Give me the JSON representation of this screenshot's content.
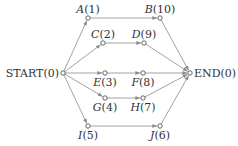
{
  "diagram": {
    "type": "activity-network",
    "nodes": [
      {
        "id": "START",
        "label": "START",
        "value": "0",
        "x": 63,
        "y": 73,
        "italic": false,
        "label_pos": "left"
      },
      {
        "id": "A",
        "label": "A",
        "value": "1",
        "x": 88,
        "y": 18,
        "italic": true,
        "label_pos": "above"
      },
      {
        "id": "B",
        "label": "B",
        "value": "10",
        "x": 160,
        "y": 18,
        "italic": true,
        "label_pos": "above"
      },
      {
        "id": "C",
        "label": "C",
        "value": "2",
        "x": 103,
        "y": 43,
        "italic": true,
        "label_pos": "above"
      },
      {
        "id": "D",
        "label": "D",
        "value": "9",
        "x": 144,
        "y": 43,
        "italic": true,
        "label_pos": "above"
      },
      {
        "id": "E",
        "label": "E",
        "value": "3",
        "x": 105,
        "y": 73,
        "italic": true,
        "label_pos": "below"
      },
      {
        "id": "F",
        "label": "F",
        "value": "8",
        "x": 143,
        "y": 73,
        "italic": true,
        "label_pos": "below"
      },
      {
        "id": "G",
        "label": "G",
        "value": "4",
        "x": 105,
        "y": 98,
        "italic": true,
        "label_pos": "below"
      },
      {
        "id": "H",
        "label": "H",
        "value": "7",
        "x": 143,
        "y": 98,
        "italic": true,
        "label_pos": "below"
      },
      {
        "id": "I",
        "label": "I",
        "value": "5",
        "x": 88,
        "y": 126,
        "italic": true,
        "label_pos": "below"
      },
      {
        "id": "J",
        "label": "J",
        "value": "6",
        "x": 160,
        "y": 126,
        "italic": true,
        "label_pos": "below"
      },
      {
        "id": "END",
        "label": "END",
        "value": "0",
        "x": 190,
        "y": 73,
        "italic": false,
        "label_pos": "right"
      }
    ],
    "edges": [
      {
        "from": "START",
        "to": "A"
      },
      {
        "from": "START",
        "to": "C"
      },
      {
        "from": "START",
        "to": "E"
      },
      {
        "from": "START",
        "to": "G"
      },
      {
        "from": "START",
        "to": "I"
      },
      {
        "from": "A",
        "to": "B"
      },
      {
        "from": "C",
        "to": "D"
      },
      {
        "from": "E",
        "to": "F"
      },
      {
        "from": "G",
        "to": "H"
      },
      {
        "from": "I",
        "to": "J"
      },
      {
        "from": "B",
        "to": "END"
      },
      {
        "from": "D",
        "to": "END"
      },
      {
        "from": "F",
        "to": "END"
      },
      {
        "from": "H",
        "to": "END"
      },
      {
        "from": "J",
        "to": "END"
      }
    ],
    "colors": {
      "edge": "#8a8a8a",
      "node_stroke": "#555555",
      "text": "#333333"
    }
  }
}
